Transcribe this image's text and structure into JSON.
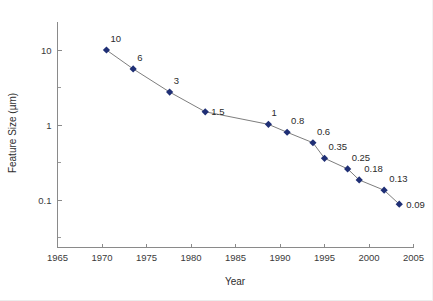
{
  "chart_data": {
    "type": "line",
    "title": "",
    "xlabel": "Year",
    "ylabel": "Feature Size (µm)",
    "xlim": [
      1965,
      2005
    ],
    "ylim": [
      0.04,
      20
    ],
    "yscale": "log",
    "xscale": "linear",
    "grid": false,
    "legend": null,
    "xticks": [
      "1965",
      "1970",
      "1975",
      "1980",
      "1985",
      "1990",
      "1995",
      "2000",
      "2005"
    ],
    "xtick_values": [
      1965,
      1970,
      1975,
      1980,
      1985,
      1990,
      1995,
      2000,
      2005
    ],
    "yticks": [
      "10",
      "1",
      "0.1"
    ],
    "ytick_values": [
      10,
      1,
      0.1
    ],
    "yminor_ticks": [
      3.16,
      0.316,
      0.0316
    ],
    "marker": "diamond",
    "marker_color": "#1f2f75",
    "line_color": "#6e6e6e",
    "series": [
      {
        "name": "Feature Size",
        "points": [
          {
            "x": 1970.5,
            "y": 10,
            "label": "10",
            "lx": 4,
            "ly": -8
          },
          {
            "x": 1973.5,
            "y": 5.6,
            "label": "6",
            "lx": 4,
            "ly": -8
          },
          {
            "x": 1977.6,
            "y": 2.75,
            "label": "3",
            "lx": 4,
            "ly": -8
          },
          {
            "x": 1981.6,
            "y": 1.5,
            "label": "1.5",
            "lx": 6,
            "ly": 3.5
          },
          {
            "x": 1988.7,
            "y": 1.02,
            "label": "1",
            "lx": 3,
            "ly": -8
          },
          {
            "x": 1990.8,
            "y": 0.8,
            "label": "0.8",
            "lx": 4,
            "ly": -8
          },
          {
            "x": 1993.7,
            "y": 0.58,
            "label": "0.6",
            "lx": 4,
            "ly": -8
          },
          {
            "x": 1995.0,
            "y": 0.36,
            "label": "0.35",
            "lx": 4,
            "ly": -8
          },
          {
            "x": 1997.6,
            "y": 0.26,
            "label": "0.25",
            "lx": 4,
            "ly": -8
          },
          {
            "x": 1998.9,
            "y": 0.185,
            "label": "0.18",
            "lx": 5,
            "ly": -8
          },
          {
            "x": 2001.7,
            "y": 0.135,
            "label": "0.13",
            "lx": 5,
            "ly": -8
          },
          {
            "x": 2003.4,
            "y": 0.088,
            "label": "0.09",
            "lx": 7,
            "ly": 3.5
          }
        ]
      }
    ]
  },
  "axes": {
    "x_title": "Year",
    "y_title": "Feature Size (µm)"
  }
}
